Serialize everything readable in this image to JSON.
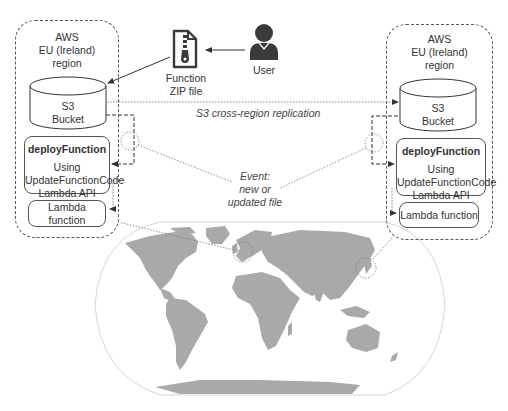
{
  "diagram": {
    "colors": {
      "stroke": "#555555",
      "land": "#a9a9a9",
      "text": "#333333",
      "icon": "#3a3a3a"
    },
    "left_region": {
      "title_lines": [
        "AWS",
        "EU (Ireland)",
        "region"
      ],
      "bucket": {
        "line1": "S3",
        "line2": "Bucket"
      },
      "deploy": {
        "title": "deployFunction",
        "lines": [
          "Using",
          "UpdateFunctionCode",
          "Lambda API"
        ]
      },
      "lambda_label": "Lambda function"
    },
    "right_region": {
      "title_lines": [
        "AWS",
        "EU (Ireland)",
        "region"
      ],
      "bucket": {
        "line1": "S3",
        "line2": "Bucket"
      },
      "deploy": {
        "title": "deployFunction",
        "lines": [
          "Using",
          "UpdateFunctionCode",
          "Lambda API"
        ]
      },
      "lambda_label": "Lambda function"
    },
    "zip_file": {
      "icon": "zip-file-icon",
      "line1": "Function",
      "line2": "ZIP file"
    },
    "user": {
      "icon": "user-icon",
      "label": "User"
    },
    "replication_label": "S3 cross-region replication",
    "event_label": {
      "line1": "Event:",
      "line2": "new or",
      "line3": "updated file"
    },
    "map": {
      "icon": "world-map-icon",
      "projection": "Robinson-style world map",
      "highlights": [
        "Europe (Ireland)",
        "East Asia (Japan/Korea)"
      ]
    }
  }
}
